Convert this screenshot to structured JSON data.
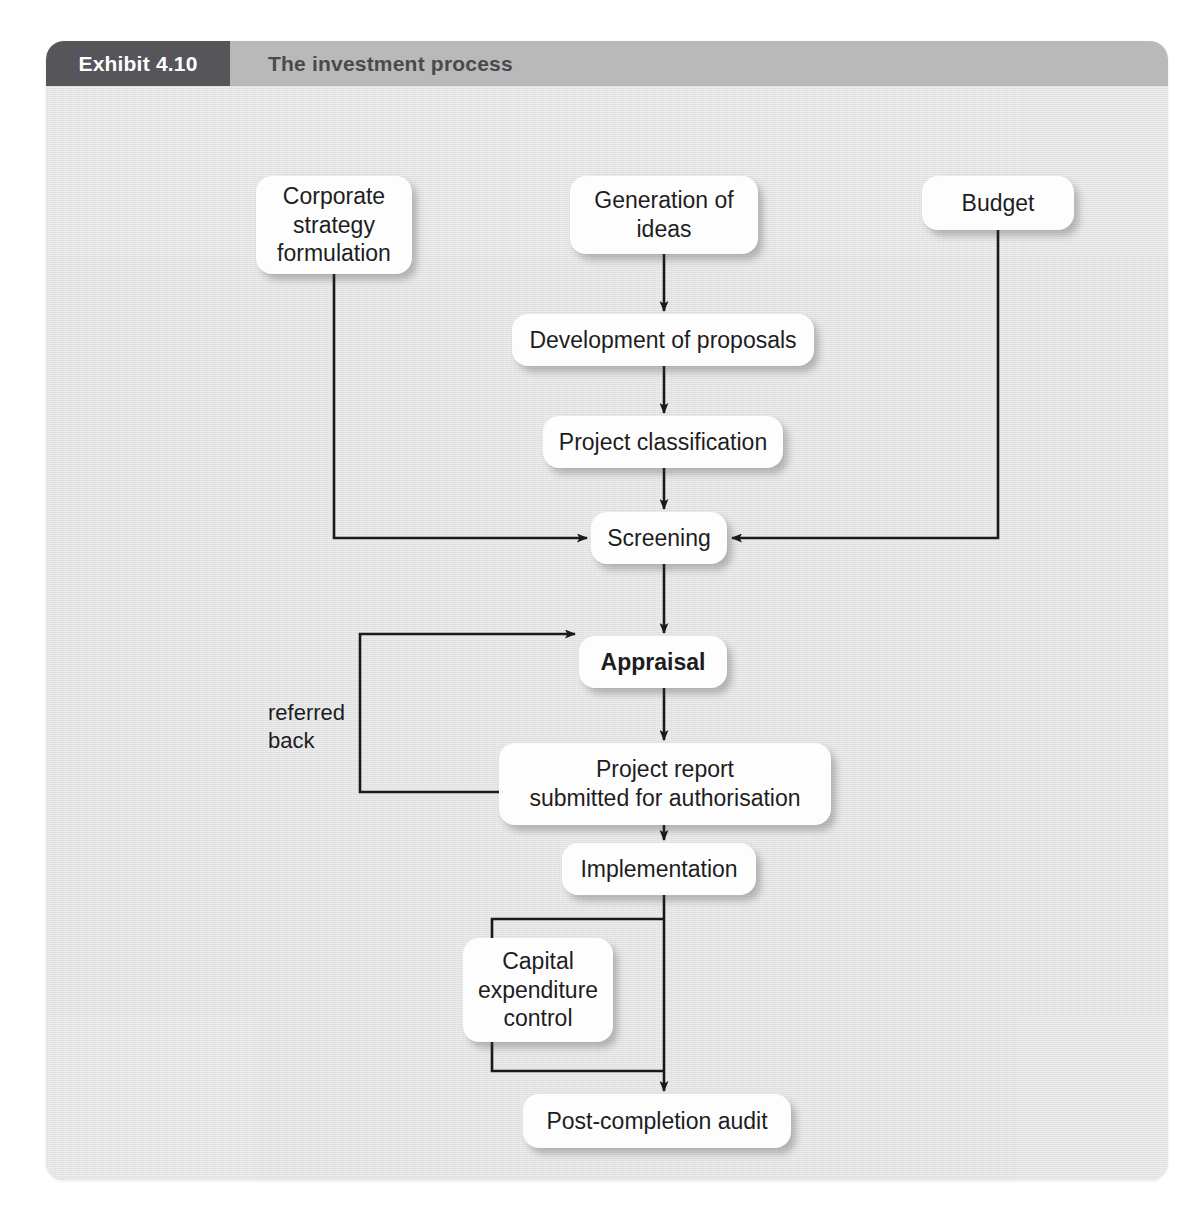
{
  "exhibit": {
    "tab_label": "Exhibit 4.10",
    "title": "The investment process"
  },
  "colors": {
    "panel_background": "#e3e3e3",
    "header_band": "#b9b9b9",
    "tab_background": "#56565a",
    "tab_text": "#ffffff",
    "title_text": "#4a4a4e",
    "node_background": "#fdfdfd",
    "node_text": "#1d1d1f",
    "connector": "#1a1a1a"
  },
  "diagram": {
    "nodes": [
      {
        "id": "corporate-strategy-formulation",
        "label": "Corporate\nstrategy\nformulation",
        "x": 210,
        "y": 90,
        "w": 156,
        "h": 98,
        "bold": false
      },
      {
        "id": "generation-of-ideas",
        "label": "Generation of\nideas",
        "x": 524,
        "y": 90,
        "w": 188,
        "h": 78,
        "bold": false
      },
      {
        "id": "budget",
        "label": "Budget",
        "x": 876,
        "y": 90,
        "w": 152,
        "h": 54,
        "bold": false
      },
      {
        "id": "development-of-proposals",
        "label": "Development of proposals",
        "x": 466,
        "y": 228,
        "w": 302,
        "h": 52,
        "bold": false
      },
      {
        "id": "project-classification",
        "label": "Project classification",
        "x": 497,
        "y": 330,
        "w": 240,
        "h": 52,
        "bold": false
      },
      {
        "id": "screening",
        "label": "Screening",
        "x": 545,
        "y": 426,
        "w": 136,
        "h": 52,
        "bold": false
      },
      {
        "id": "appraisal",
        "label": "Appraisal",
        "x": 533,
        "y": 550,
        "w": 148,
        "h": 52,
        "bold": true
      },
      {
        "id": "project-report-submitted-for-authorisation",
        "label": "Project report\nsubmitted for authorisation",
        "x": 453,
        "y": 657,
        "w": 332,
        "h": 82,
        "bold": false
      },
      {
        "id": "implementation",
        "label": "Implementation",
        "x": 516,
        "y": 757,
        "w": 194,
        "h": 52,
        "bold": false
      },
      {
        "id": "capital-expenditure-control",
        "label": "Capital\nexpenditure\ncontrol",
        "x": 417,
        "y": 852,
        "w": 150,
        "h": 104,
        "bold": false
      },
      {
        "id": "post-completion-audit",
        "label": "Post-completion audit",
        "x": 477,
        "y": 1008,
        "w": 268,
        "h": 54,
        "bold": false
      }
    ],
    "labels": [
      {
        "id": "referred-back",
        "text": "referred\nback",
        "x": 222,
        "y": 613
      }
    ],
    "edges": [
      {
        "from": "generation-of-ideas",
        "to": "development-of-proposals",
        "type": "straight-down"
      },
      {
        "from": "development-of-proposals",
        "to": "project-classification",
        "type": "straight-down"
      },
      {
        "from": "project-classification",
        "to": "screening",
        "type": "straight-down"
      },
      {
        "from": "corporate-strategy-formulation",
        "to": "screening",
        "type": "down-then-right"
      },
      {
        "from": "budget",
        "to": "screening",
        "type": "down-then-left"
      },
      {
        "from": "screening",
        "to": "appraisal",
        "type": "straight-down"
      },
      {
        "from": "appraisal",
        "to": "project-report-submitted-for-authorisation",
        "type": "straight-down"
      },
      {
        "from": "project-report-submitted-for-authorisation",
        "to": "appraisal",
        "type": "referred-back-loop"
      },
      {
        "from": "project-report-submitted-for-authorisation",
        "to": "implementation",
        "type": "straight-down"
      },
      {
        "from": "implementation",
        "to": "capital-expenditure-control",
        "type": "side-loop-out"
      },
      {
        "from": "capital-expenditure-control",
        "to": "post-completion-audit",
        "type": "side-loop-in"
      },
      {
        "from": "implementation",
        "to": "post-completion-audit",
        "type": "straight-down"
      }
    ]
  }
}
